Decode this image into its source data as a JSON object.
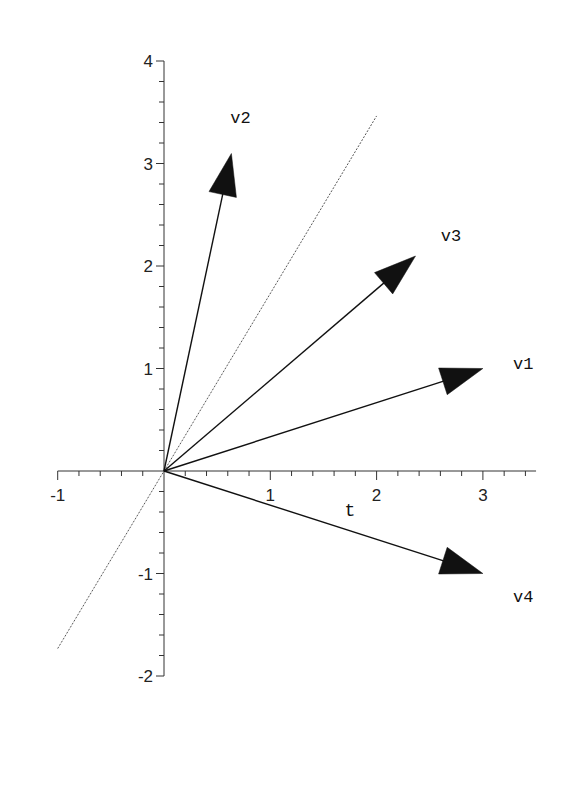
{
  "chart_data": {
    "type": "line",
    "subtype": "vector-field-plot",
    "title": "",
    "xlabel": "t",
    "ylabel": "",
    "xlim": [
      -1,
      3.5
    ],
    "ylim": [
      -2,
      4
    ],
    "grid": false,
    "legend": null,
    "x_ticks": [
      -1,
      1,
      2,
      3
    ],
    "y_ticks": [
      -2,
      -1,
      1,
      2,
      3,
      4
    ],
    "x_minor_step": 0.2,
    "y_minor_step": 0.2,
    "vectors": [
      {
        "name": "v1",
        "from": [
          0,
          0
        ],
        "to": [
          3,
          1
        ],
        "label_pos": [
          3.38,
          1.05
        ]
      },
      {
        "name": "v2",
        "from": [
          0,
          0
        ],
        "to": [
          0.634,
          3.098
        ],
        "label_pos": [
          0.72,
          3.45
        ]
      },
      {
        "name": "v3",
        "from": [
          0,
          0
        ],
        "to": [
          2.366,
          2.098
        ],
        "label_pos": [
          2.7,
          2.3
        ]
      },
      {
        "name": "v4",
        "from": [
          0,
          0
        ],
        "to": [
          3,
          -1
        ],
        "label_pos": [
          3.38,
          -1.22
        ]
      }
    ],
    "series": [
      {
        "name": "y = sqrt(3)*t",
        "style": "dotted",
        "x": [
          -1,
          2
        ],
        "y": [
          -1.732,
          3.464
        ]
      }
    ],
    "annotations": [
      "v1",
      "v2",
      "v3",
      "v4",
      "t"
    ]
  },
  "layout": {
    "origin_px": [
      164,
      471
    ],
    "px_per_unit_x": 106.3,
    "px_per_unit_y": 102.5,
    "xlabel_pos": [
      1.75,
      -0.4
    ]
  },
  "colors": {
    "axes": "#333333",
    "vectors": "#111111",
    "reference_line": "#444444",
    "background": "#ffffff"
  }
}
